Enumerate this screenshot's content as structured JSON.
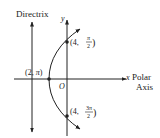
{
  "diagram": {
    "type": "parabola-polar",
    "labels": {
      "directrix": "Directrix",
      "y_axis": "y",
      "x_axis": "x",
      "polar_axis_line1": "Polar",
      "polar_axis_line2": "Axis",
      "origin": "O"
    },
    "points": [
      {
        "r": "2",
        "theta": "π",
        "label_open": "(2, ",
        "label_theta": "π",
        "label_close": ")"
      },
      {
        "r": "4",
        "theta": "π/2",
        "label_r": "(4, ",
        "num": "π",
        "den": "2"
      },
      {
        "r": "4",
        "theta": "3π/2",
        "label_r": "(4, ",
        "num": "3π",
        "den": "2"
      }
    ],
    "colors": {
      "stroke": "#222222",
      "background": "#ffffff"
    }
  }
}
